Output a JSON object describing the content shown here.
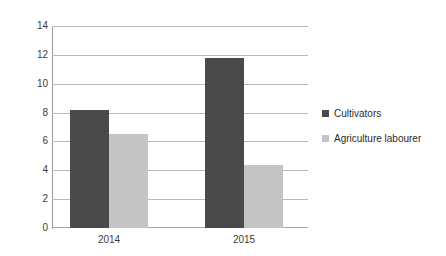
{
  "chart_data": {
    "type": "bar",
    "title": "",
    "subtitle": "",
    "xlabel": "",
    "ylabel": "",
    "categories": [
      "2014",
      "2015"
    ],
    "series": [
      {
        "name": "Cultivators",
        "color": "#4a4a4a",
        "values": [
          8.2,
          11.8
        ]
      },
      {
        "name": "Agriculture labourer",
        "color": "#c4c4c4",
        "values": [
          6.5,
          4.35
        ]
      }
    ],
    "ylim": [
      0,
      14
    ],
    "y_ticks": [
      0,
      2,
      4,
      6,
      8,
      10,
      12,
      14
    ],
    "y_tick_labels": [
      "0",
      "2",
      "4",
      "6",
      "8",
      "10",
      "12",
      "14"
    ],
    "grid": true,
    "grid_axis": "y",
    "legend_position": "right",
    "colors": {
      "gridline": "#b9b9b9",
      "axis": "#9a9a9a",
      "text": "#3c3c3c",
      "background": "#ffffff"
    }
  }
}
